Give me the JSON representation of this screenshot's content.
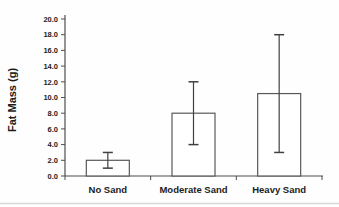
{
  "chart_data": {
    "type": "bar",
    "title": "",
    "xlabel": "",
    "ylabel": "Fat Mass (g)",
    "categories": [
      "No Sand",
      "Moderate Sand",
      "Heavy Sand"
    ],
    "values": [
      2.0,
      8.0,
      10.5
    ],
    "errors": {
      "lower": [
        1.0,
        4.0,
        3.0
      ],
      "upper": [
        3.0,
        12.0,
        18.0
      ]
    },
    "ylim": [
      0,
      20
    ],
    "ytick_step": 2.0,
    "ytick_labels": [
      "0.0",
      "2.0",
      "4.0",
      "6.0",
      "8.0",
      "10.0",
      "12.0",
      "14.0",
      "16.0",
      "18.0",
      "20.0"
    ],
    "grid": false,
    "legend": null
  },
  "style": {
    "background": "#fefefe",
    "bar_fill": "#ffffff",
    "bar_border": "#595959",
    "axis_color": "#4d4d4d",
    "error_color": "#404040",
    "text_color": "#1c1c1c",
    "divider_color": "#d9d9d9"
  }
}
